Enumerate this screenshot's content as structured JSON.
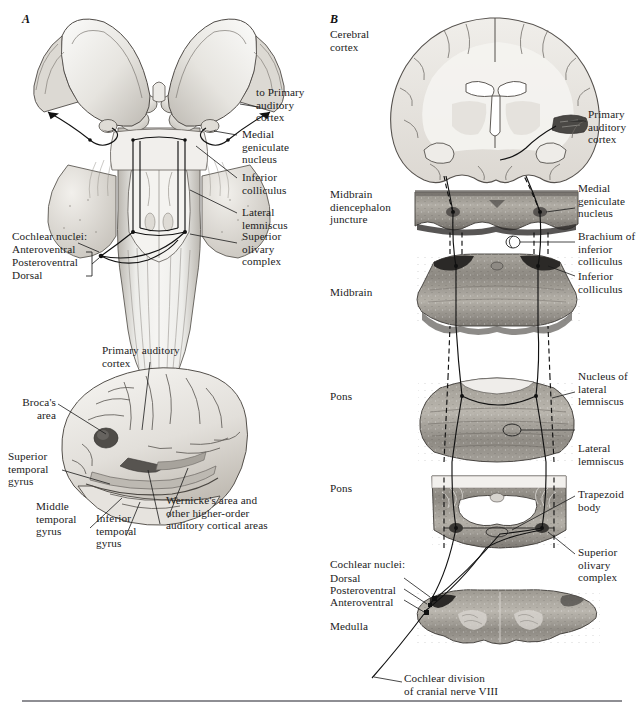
{
  "figure": {
    "panels": [
      {
        "id": "A",
        "letter": "A"
      },
      {
        "id": "B",
        "letter": "B"
      }
    ]
  },
  "panel_a": {
    "letter": "A",
    "view_top": {
      "name": "dorsal-brainstem-view",
      "labels": [
        {
          "key": "to_primary_auditory_cortex",
          "text": "to Primary\nauditory\ncortex"
        },
        {
          "key": "medial_geniculate_nucleus",
          "text": "Medial\ngeniculate\nnucleus"
        },
        {
          "key": "inferior_colliculus",
          "text": "Inferior\ncolliculus"
        },
        {
          "key": "lateral_lemniscus",
          "text": "Lateral\nlemniscus"
        },
        {
          "key": "superior_olivary_complex",
          "text": "Superior\nolivary\ncomplex"
        },
        {
          "key": "cochlear_nuclei_header",
          "text": "Cochlear nuclei:"
        },
        {
          "key": "anteroventral",
          "text": "Anteroventral"
        },
        {
          "key": "posteroventral",
          "text": "Posteroventral"
        },
        {
          "key": "dorsal",
          "text": "Dorsal"
        }
      ]
    },
    "view_lateral": {
      "name": "lateral-cerebral-hemisphere-view",
      "labels": [
        {
          "key": "primary_auditory_cortex",
          "text": "Primary auditory\ncortex"
        },
        {
          "key": "brocas_area",
          "text": "Broca's\narea"
        },
        {
          "key": "superior_temporal_gyrus",
          "text": "Superior\ntemporal\ngyrus"
        },
        {
          "key": "middle_temporal_gyrus",
          "text": "Middle\ntemporal\ngyrus"
        },
        {
          "key": "inferior_temporal_gyrus",
          "text": "Inferior\ntemporal\ngyrus"
        },
        {
          "key": "wernickes_area",
          "text": "Wernicke's area and\nother higher-order\nauditory cortical areas"
        }
      ]
    }
  },
  "panel_b": {
    "letter": "B",
    "name": "sectional-auditory-pathway",
    "levels_left": [
      {
        "key": "cerebral_cortex",
        "text": "Cerebral\ncortex"
      },
      {
        "key": "midbrain_diencephalon_juncture",
        "text": "Midbrain\ndiencephalon\njuncture"
      },
      {
        "key": "midbrain",
        "text": "Midbrain"
      },
      {
        "key": "pons_upper",
        "text": "Pons"
      },
      {
        "key": "pons_lower",
        "text": "Pons"
      },
      {
        "key": "medulla",
        "text": "Medulla"
      }
    ],
    "cochlear_nuclei_group": {
      "header": "Cochlear nuclei:",
      "items": [
        {
          "key": "dorsal",
          "text": "Dorsal"
        },
        {
          "key": "posteroventral",
          "text": "Posteroventral"
        },
        {
          "key": "anteroventral",
          "text": "Anteroventral"
        }
      ]
    },
    "labels_right": [
      {
        "key": "primary_auditory_cortex",
        "text": "Primary\nauditory\ncortex"
      },
      {
        "key": "medial_geniculate_nucleus",
        "text": "Medial\ngeniculate\nnucleus"
      },
      {
        "key": "brachium_inferior_colliculus",
        "text": "Brachium of\ninferior\ncolliculus"
      },
      {
        "key": "inferior_colliculus",
        "text": "Inferior\ncolliculus"
      },
      {
        "key": "nucleus_lateral_lemniscus",
        "text": "Nucleus of\nlateral\nlemniscus"
      },
      {
        "key": "lateral_lemniscus",
        "text": "Lateral\nlemniscus"
      },
      {
        "key": "trapezoid_body",
        "text": "Trapezoid\nbody"
      },
      {
        "key": "superior_olivary_complex",
        "text": "Superior\nolivary\ncomplex"
      }
    ],
    "nerve_label": {
      "key": "cochlear_division_cn8",
      "text": "Cochlear division\nof cranial nerve VIII"
    }
  },
  "colors": {
    "ink": "#1b1b1b",
    "rule": "#8e8e93",
    "tissue_light": "#e8e6e2",
    "tissue_mid": "#c9c6c0",
    "tissue_dark": "#9a968f",
    "highlight_dark": "#4a4a4a",
    "background": "#ffffff"
  }
}
